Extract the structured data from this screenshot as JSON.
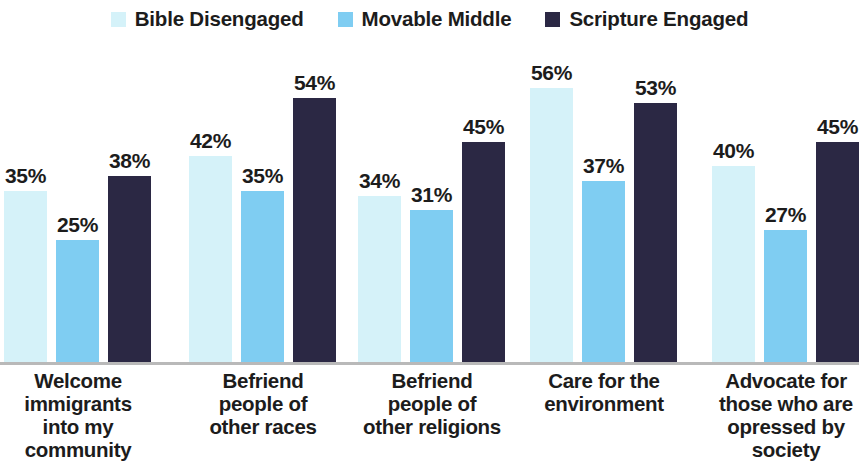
{
  "legend": {
    "items": [
      {
        "label": "Bible Disengaged",
        "color": "#d5f2f9",
        "swatch_icon": "square-swatch-icon"
      },
      {
        "label": "Movable Middle",
        "color": "#7fcdf2",
        "swatch_icon": "square-swatch-icon"
      },
      {
        "label": "Scripture Engaged",
        "color": "#2b2844",
        "swatch_icon": "square-swatch-icon"
      }
    ]
  },
  "chart_data": {
    "type": "bar",
    "title": "",
    "xlabel": "",
    "ylabel": "",
    "ylim": [
      0,
      60
    ],
    "grid": false,
    "legend_position": "top-center",
    "value_suffix": "%",
    "categories": [
      "Welcome immigrants into my community",
      "Befriend people of other races",
      "Befriend people of other religions",
      "Care for the environment",
      "Advocate for those who are opressed by society"
    ],
    "category_lines": [
      [
        "Welcome",
        "immigrants",
        "into my",
        "community"
      ],
      [
        "Befriend",
        "people of",
        "other races"
      ],
      [
        "Befriend",
        "people of",
        "other religions"
      ],
      [
        "Care for the",
        "environment"
      ],
      [
        "Advocate for",
        "those who are",
        "opressed by",
        "society"
      ]
    ],
    "series": [
      {
        "name": "Bible Disengaged",
        "color": "#d5f2f9",
        "values": [
          35,
          42,
          34,
          56,
          40
        ],
        "labels": [
          "35%",
          "42%",
          "34%",
          "56%",
          "40%"
        ]
      },
      {
        "name": "Movable Middle",
        "color": "#7fcdf2",
        "values": [
          25,
          35,
          31,
          37,
          27
        ],
        "labels": [
          "25%",
          "35%",
          "31%",
          "37%",
          "27%"
        ]
      },
      {
        "name": "Scripture Engaged",
        "color": "#2b2844",
        "values": [
          38,
          54,
          45,
          53,
          45
        ],
        "labels": [
          "38%",
          "54%",
          "45%",
          "53%",
          "45%"
        ]
      }
    ]
  },
  "axis": {
    "baseline_color": "#b9b9b9"
  }
}
